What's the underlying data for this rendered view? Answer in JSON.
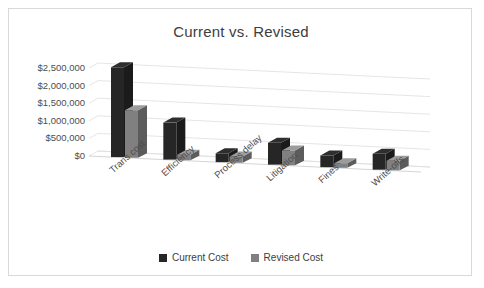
{
  "chart": {
    "title": "Current vs. Revised",
    "frame_border_color": "#d9d9d9",
    "background": "#ffffff"
  },
  "legend": {
    "position": "bottom",
    "items": [
      {
        "label": "Current Cost",
        "color": "#262626",
        "icon": "square-swatch-icon"
      },
      {
        "label": "Revised Cost",
        "color": "#808080",
        "icon": "square-swatch-icon"
      }
    ]
  },
  "axis": {
    "y_ticks": [
      "$0",
      "$500,000",
      "$1,000,000",
      "$1,500,000",
      "$2,000,000",
      "$2,500,000"
    ],
    "y_tick_values": [
      0,
      500000,
      1000000,
      1500000,
      2000000,
      2500000
    ]
  },
  "chart_data": {
    "type": "bar",
    "title": "Current vs. Revised",
    "xlabel": "",
    "ylabel": "",
    "ylim": [
      0,
      2500000
    ],
    "grid": true,
    "legend_position": "bottom",
    "three_d": true,
    "categories": [
      "Trans cost",
      "Efficiency",
      "Process delay",
      "Litigation",
      "Fines",
      "Write-offs"
    ],
    "series": [
      {
        "name": "Current Cost",
        "color": "#262626",
        "values": [
          2550000,
          1050000,
          250000,
          620000,
          330000,
          450000
        ]
      },
      {
        "name": "Revised Cost",
        "color": "#808080",
        "values": [
          1350000,
          160000,
          180000,
          420000,
          130000,
          270000
        ]
      }
    ],
    "ytick_labels": [
      "$0",
      "$500,000",
      "$1,000,000",
      "$1,500,000",
      "$2,000,000",
      "$2,500,000"
    ],
    "ytick_values": [
      0,
      500000,
      1000000,
      1500000,
      2000000,
      2500000
    ]
  }
}
